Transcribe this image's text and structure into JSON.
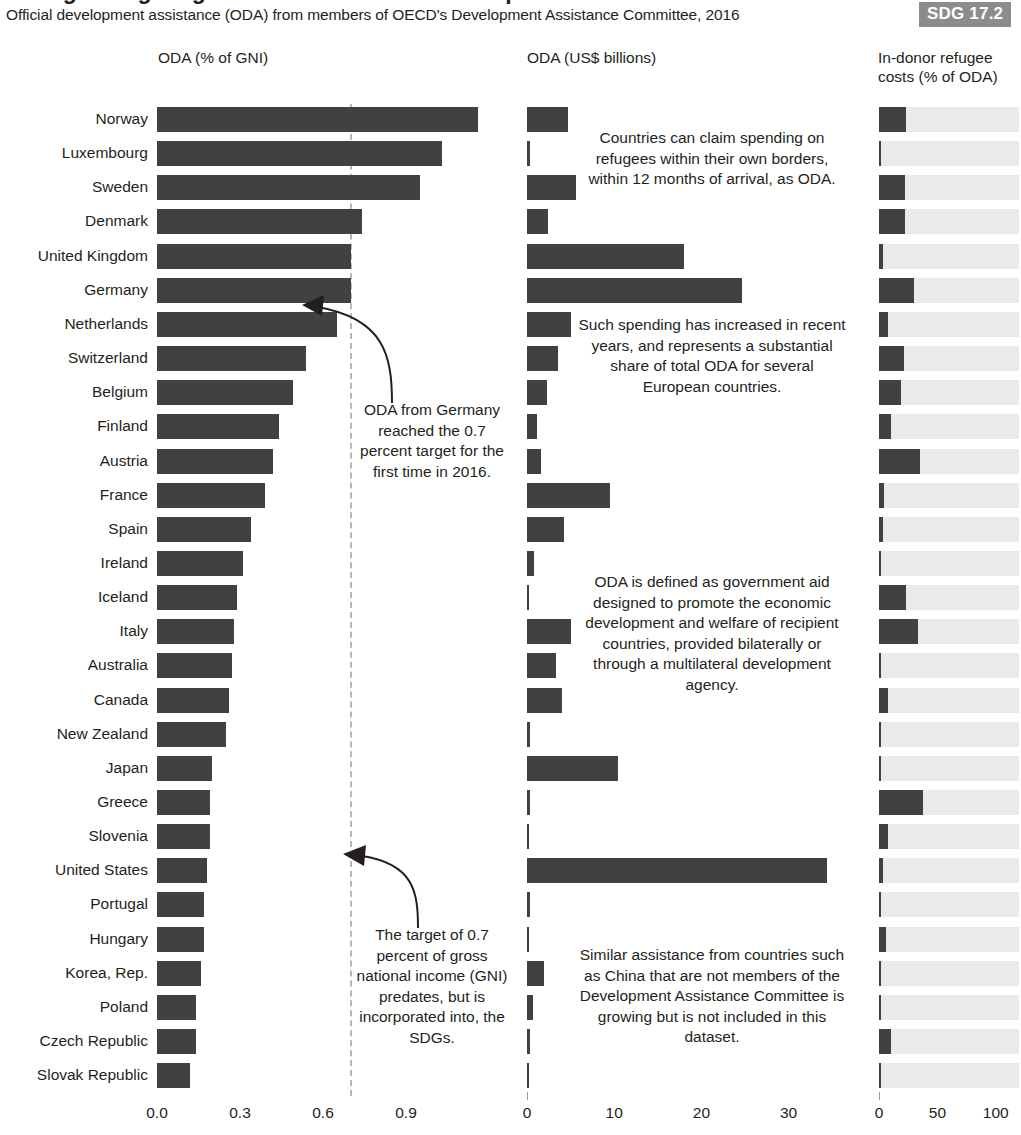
{
  "header": {
    "title": "Foreign aid giving reaches a record in development aid",
    "subtitle": "Official development assistance (ODA) from members of OECD's Development Assistance Committee, 2016",
    "sdg_badge": "SDG 17.2",
    "badge_color": "#8c8c8c"
  },
  "panels": {
    "left_header": "ODA (% of GNI)",
    "mid_header": "ODA (US$ billions)",
    "right_header_line1": "In-donor refugee",
    "right_header_line2": "costs (% of ODA)"
  },
  "annotations": {
    "germany": "ODA from Germany reached the 0.7 percent target for the first time in 2016.",
    "target": "The target of 0.7 percent of gross national income (GNI) predates, but is incorporated into, the SDGs.",
    "note1": "Countries can claim spending on refugees within their own borders, within 12 months of arrival, as ODA.",
    "note2": "Such spending has increased in recent years, and represents a substantial share of total ODA for several European countries.",
    "note3": "ODA is defined as government aid designed to promote the economic development and welfare of recipient countries, provided bilaterally or through a multilateral development agency.",
    "note4": "Similar assistance from countries such as China that are not members of the Development Assistance Committee is growing but is not included in this dataset."
  },
  "chart_data": {
    "type": "bar",
    "title": "Official development assistance (ODA) from members of OECD's Development Assistance Committee, 2016",
    "orientation": "horizontal",
    "grid": false,
    "legend": "none",
    "reference_line": {
      "panel": "oda_pct_gni",
      "value": 0.7,
      "style": "dashed",
      "color": "#b7b7b7"
    },
    "categories": [
      "Norway",
      "Luxembourg",
      "Sweden",
      "Denmark",
      "United Kingdom",
      "Germany",
      "Netherlands",
      "Switzerland",
      "Belgium",
      "Finland",
      "Austria",
      "France",
      "Spain",
      "Ireland",
      "Iceland",
      "Italy",
      "Australia",
      "Canada",
      "New Zealand",
      "Japan",
      "Greece",
      "Slovenia",
      "United States",
      "Portugal",
      "Hungary",
      "Korea, Rep.",
      "Poland",
      "Czech Republic",
      "Slovak Republic"
    ],
    "series": [
      {
        "name": "ODA (% of GNI)",
        "panel": "oda_pct_gni",
        "xlabel": "ODA (% of GNI)",
        "xlim": [
          0.0,
          1.25
        ],
        "ticks": [
          0.0,
          0.3,
          0.6,
          0.9
        ],
        "tick_labels": [
          "0.0",
          "0.3",
          "0.6",
          "0.9"
        ],
        "values": [
          1.16,
          1.03,
          0.95,
          0.74,
          0.7,
          0.7,
          0.65,
          0.54,
          0.49,
          0.44,
          0.42,
          0.39,
          0.34,
          0.31,
          0.29,
          0.28,
          0.27,
          0.26,
          0.25,
          0.2,
          0.19,
          0.19,
          0.18,
          0.17,
          0.17,
          0.16,
          0.14,
          0.14,
          0.12
        ]
      },
      {
        "name": "ODA (US$ billions)",
        "panel": "oda_usd",
        "xlabel": "ODA (US$ billions)",
        "xlim": [
          0,
          37
        ],
        "ticks": [
          0,
          10,
          20,
          30
        ],
        "tick_labels": [
          "0",
          "10",
          "20",
          "30"
        ],
        "values": [
          4.7,
          0.4,
          5.6,
          2.4,
          18.0,
          24.7,
          5.0,
          3.6,
          2.3,
          1.1,
          1.6,
          9.5,
          4.3,
          0.8,
          0.06,
          5.1,
          3.3,
          4.0,
          0.4,
          10.4,
          0.3,
          0.08,
          34.4,
          0.4,
          0.2,
          2.0,
          0.7,
          0.3,
          0.1
        ]
      },
      {
        "name": "In-donor refugee costs (% of ODA)",
        "panel": "refugee_pct",
        "xlabel": "In-donor refugee costs (% of ODA)",
        "xlim": [
          0,
          110
        ],
        "ticks": [
          0,
          50,
          100
        ],
        "tick_labels": [
          "0",
          "50",
          "100"
        ],
        "values": [
          23,
          1,
          22,
          22,
          3,
          30,
          8,
          21,
          19,
          10,
          35,
          4,
          3,
          1,
          23,
          33,
          1,
          8,
          2,
          1,
          38,
          8,
          3,
          1,
          6,
          1,
          2,
          10,
          2
        ]
      }
    ]
  }
}
